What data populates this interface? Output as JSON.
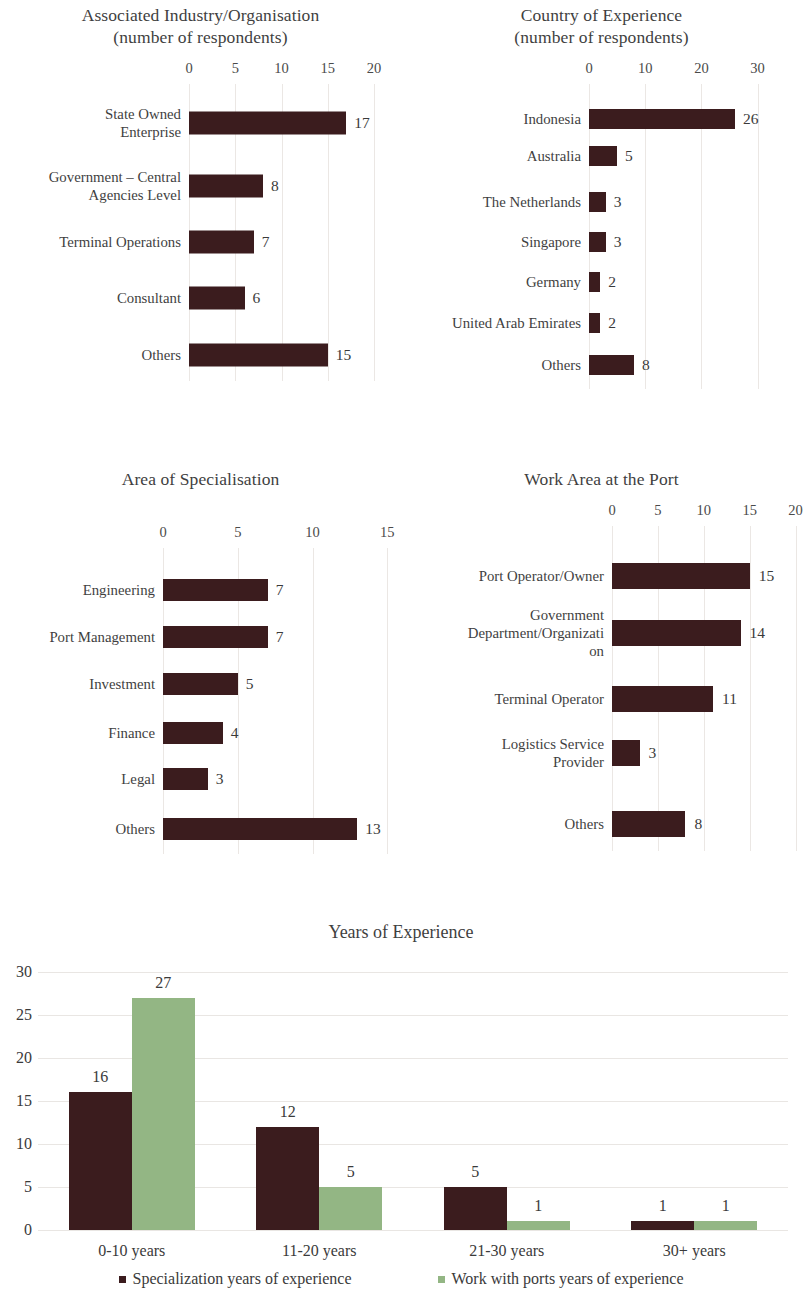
{
  "colors": {
    "bar_dark": "#3b1c1e",
    "bar_green": "#93b684",
    "gridline": "#e9e6e3",
    "text": "#3a3a3a"
  },
  "charts": [
    {
      "id": "associated-industry",
      "title_line1": "Associated Industry/Organisation",
      "title_line2": "(number of respondents)",
      "chart_data": {
        "type": "bar",
        "orientation": "horizontal",
        "title": "Associated Industry/Organisation (number of respondents)",
        "xlabel": "",
        "ylabel": "",
        "xlim": [
          0,
          20
        ],
        "ticks": [
          0,
          5,
          10,
          15,
          20
        ],
        "grid": true,
        "legend": "none",
        "categories": [
          "State Owned Enterprise",
          "Government – Central Agencies Level",
          "Terminal Operations",
          "Consultant",
          "Others"
        ],
        "values": [
          17,
          8,
          7,
          6,
          15
        ],
        "label_lines": [
          [
            "State Owned",
            "Enterprise"
          ],
          [
            "Government – Central",
            "Agencies Level"
          ],
          [
            "Terminal Operations"
          ],
          [
            "Consultant"
          ],
          [
            "Others"
          ]
        ]
      }
    },
    {
      "id": "country-of-experience",
      "title_line1": "Country of Experience",
      "title_line2": "(number of respondents)",
      "chart_data": {
        "type": "bar",
        "orientation": "horizontal",
        "title": "Country of Experience (number of respondents)",
        "xlabel": "",
        "ylabel": "",
        "xlim": [
          0,
          30
        ],
        "ticks": [
          0,
          10,
          20,
          30
        ],
        "grid": true,
        "legend": "none",
        "categories": [
          "Indonesia",
          "Australia",
          "The Netherlands",
          "Singapore",
          "Germany",
          "United Arab Emirates",
          "Others"
        ],
        "values": [
          26,
          5,
          3,
          3,
          2,
          2,
          8
        ],
        "label_lines": [
          [
            "Indonesia"
          ],
          [
            "Australia"
          ],
          [
            "The Netherlands"
          ],
          [
            "Singapore"
          ],
          [
            "Germany"
          ],
          [
            "United Arab Emirates"
          ],
          [
            "Others"
          ]
        ]
      }
    },
    {
      "id": "area-of-specialisation",
      "title_line1": "Area of Specialisation",
      "title_line2": "",
      "chart_data": {
        "type": "bar",
        "orientation": "horizontal",
        "title": "Area of Specialisation",
        "xlabel": "",
        "ylabel": "",
        "xlim": [
          0,
          15
        ],
        "ticks": [
          0,
          5,
          10,
          15
        ],
        "grid": true,
        "legend": "none",
        "categories": [
          "Engineering",
          "Port Management",
          "Investment",
          "Finance",
          "Legal",
          "Others"
        ],
        "values": [
          7,
          7,
          5,
          4,
          3,
          13
        ],
        "label_lines": [
          [
            "Engineering"
          ],
          [
            "Port Management"
          ],
          [
            "Investment"
          ],
          [
            "Finance"
          ],
          [
            "Legal"
          ],
          [
            "Others"
          ]
        ]
      }
    },
    {
      "id": "work-area-at-the-port",
      "title_line1": "Work Area at the Port",
      "title_line2": "",
      "chart_data": {
        "type": "bar",
        "orientation": "horizontal",
        "title": "Work Area at the Port",
        "xlabel": "",
        "ylabel": "",
        "xlim": [
          0,
          20
        ],
        "ticks": [
          0,
          5,
          10,
          15,
          20
        ],
        "grid": true,
        "legend": "none",
        "categories": [
          "Port Operator/Owner",
          "Government Department/Organization",
          "Terminal Operator",
          "Logistics Service Provider",
          "Others"
        ],
        "values": [
          15,
          14,
          11,
          3,
          8
        ],
        "label_lines": [
          [
            "Port Operator/Owner"
          ],
          [
            "Government",
            "Department/Organizati",
            "on"
          ],
          [
            "Terminal Operator"
          ],
          [
            "Logistics Service",
            "Provider"
          ],
          [
            "Others"
          ]
        ]
      }
    }
  ],
  "years_chart": {
    "title": "Years of Experience",
    "legend": [
      "Specialization years of experience",
      "Work with ports years of experience"
    ],
    "chart_data": {
      "type": "bar",
      "orientation": "vertical",
      "title": "Years of Experience",
      "xlabel": "",
      "ylabel": "",
      "ylim": [
        0,
        30
      ],
      "yticks": [
        0,
        5,
        10,
        15,
        20,
        25,
        30
      ],
      "grid": true,
      "legend_position": "bottom",
      "categories": [
        "0-10 years",
        "11-20 years",
        "21-30 years",
        "30+ years"
      ],
      "series": [
        {
          "name": "Specialization years of experience",
          "color": "#3b1c1e",
          "values": [
            16,
            12,
            5,
            1
          ]
        },
        {
          "name": "Work with ports years of experience",
          "color": "#93b684",
          "values": [
            27,
            5,
            1,
            1
          ]
        }
      ]
    }
  }
}
